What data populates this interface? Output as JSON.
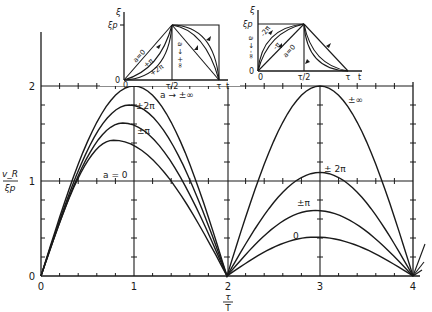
{
  "chart_data": {
    "type": "line",
    "title": "",
    "xlabel": "τ/T",
    "ylabel": "v_R / ξ_p",
    "xlim": [
      0,
      4
    ],
    "ylim": [
      0,
      2
    ],
    "grid": false,
    "x_ticks": [
      "0",
      "1",
      "2",
      "3",
      "4"
    ],
    "y_ticks": [
      "0",
      "1",
      "2"
    ],
    "series": [
      {
        "name": "a → ±∞",
        "label_main": "a → ±∞",
        "label_second": "±∞",
        "peak1": [
          1.0,
          2.0
        ],
        "peak2": [
          3.0,
          2.0
        ]
      },
      {
        "name": "±2π",
        "label_main": "±2π",
        "label_second": "±2π",
        "peak1": [
          0.95,
          1.8
        ],
        "peak2": [
          3.0,
          1.09
        ]
      },
      {
        "name": "±π",
        "label_main": "±π",
        "label_second": "±π",
        "peak1": [
          0.88,
          1.61
        ],
        "peak2": [
          2.95,
          0.69
        ]
      },
      {
        "name": "a = 0",
        "label_main": "a = 0",
        "label_second": "0",
        "peak1": [
          0.78,
          1.43
        ],
        "peak2": [
          2.95,
          0.41
        ]
      }
    ],
    "insets": [
      {
        "position": "top-left",
        "y_label": "ξ",
        "y_value_label": "ξp",
        "x_ticks": [
          "0",
          "τ/2",
          "τ"
        ],
        "x_axis_label": "t",
        "origin_label": "0",
        "curve_labels": [
          "a = 0",
          "+π",
          "+2π",
          "a → +∞"
        ]
      },
      {
        "position": "top-right",
        "y_label": "ξ",
        "y_value_label": "ξp",
        "x_ticks": [
          "0",
          "τ/2",
          "τ"
        ],
        "x_axis_label": "t",
        "origin_label": "0",
        "curve_labels": [
          "-2π",
          "-π",
          "a = 0",
          "a → -∞"
        ]
      }
    ]
  },
  "axis": {
    "y_label_num": "v_R",
    "y_label_den": "ξp",
    "x_label_num": "τ",
    "x_label_den": "T",
    "x_ticks": [
      "0",
      "1",
      "2",
      "3",
      "4"
    ],
    "y_ticks": [
      "0",
      "1",
      "2"
    ]
  },
  "labels": {
    "inf": "a → ±∞",
    "two_pi": "±2π",
    "pi": "±π",
    "zero": "a = 0",
    "inf2": "±∞",
    "two_pi2": "± 2π",
    "pi2": "±π",
    "zero2": "0"
  },
  "inset1": {
    "xi": "ξ",
    "xip": "ξp",
    "zero_y": "0",
    "zero_x": "0",
    "half": "τ/2",
    "tau": "τ",
    "t": "t",
    "a0": "a=0",
    "pi": "+π",
    "twopi": "+2π",
    "inf": "a → +∞"
  },
  "inset2": {
    "xi": "ξ",
    "xip": "ξp",
    "zero_y": "0",
    "zero_x": "0",
    "half": "τ/2",
    "tau": "τ",
    "t": "t",
    "a0": "a=0",
    "pi": "-π",
    "twopi": "-2π",
    "inf": "a → -∞"
  }
}
